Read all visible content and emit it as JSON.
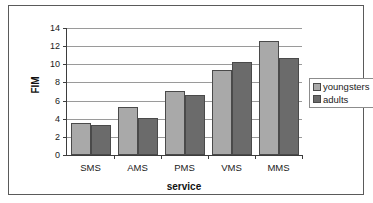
{
  "chart_data": {
    "type": "bar",
    "title": "",
    "xlabel": "service",
    "ylabel": "FIM",
    "categories": [
      "SMS",
      "AMS",
      "PMS",
      "VMS",
      "MMS"
    ],
    "series": [
      {
        "name": "youngsters",
        "color": "#a9a9a9",
        "values": [
          3.5,
          5.3,
          7.1,
          9.4,
          12.6
        ]
      },
      {
        "name": "adults",
        "color": "#6b6b6b",
        "values": [
          3.3,
          4.1,
          6.6,
          10.2,
          10.7
        ]
      }
    ],
    "ylim": [
      0,
      14
    ],
    "ytick_values": [
      0,
      2,
      4,
      6,
      8,
      10,
      12,
      14
    ],
    "ytick_labels": [
      "0",
      "2",
      "4",
      "6",
      "8",
      "10",
      "12",
      "14"
    ],
    "grid": true,
    "grid_axis": "y",
    "legend_position": "right",
    "legend_entries": [
      "youngsters",
      "adults"
    ],
    "frame": true
  },
  "colors": {
    "youngsters": "#a9a9a9",
    "adults": "#6b6b6b",
    "gridline": "#9a9a9a",
    "axis": "#3d3d3d",
    "frame": "#5a5a5a",
    "bar_outline": "#4a4a4a",
    "text": "#1a1a1a",
    "background": "#ffffff"
  }
}
